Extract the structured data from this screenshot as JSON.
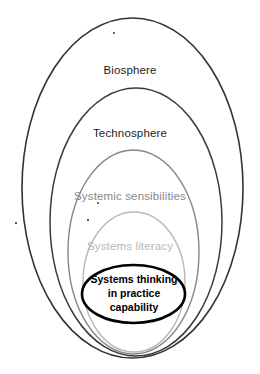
{
  "diagram": {
    "type": "nested-ellipses",
    "background_color": "#ffffff",
    "rings": [
      {
        "id": "biosphere",
        "label": "Biosphere",
        "level": 1,
        "stroke_color": "#333333",
        "stroke_width": 1.6,
        "text_color": "#1c1c1c",
        "bounds": {
          "left": 22,
          "top": 18,
          "right": 243,
          "bottom": 358
        }
      },
      {
        "id": "technosphere",
        "label": "Technosphere",
        "level": 2,
        "stroke_color": "#3a3a3a",
        "stroke_width": 1.5,
        "text_color": "#1c1c1c",
        "bounds": {
          "left": 50,
          "top": 88,
          "right": 222,
          "bottom": 356
        }
      },
      {
        "id": "systemic-sensibilities",
        "label": "Systemic sensibilities",
        "level": 3,
        "stroke_color": "#868686",
        "stroke_width": 1.4,
        "text_color": "#86888a",
        "bounds": {
          "left": 68,
          "top": 150,
          "right": 199,
          "bottom": 354
        }
      },
      {
        "id": "systems-literacy",
        "label": "Systems literacy",
        "level": 4,
        "stroke_color": "#b9b9b9",
        "stroke_width": 1.4,
        "text_color": "#b6b8ba",
        "bounds": {
          "left": 83,
          "top": 212,
          "right": 185,
          "bottom": 352
        }
      }
    ],
    "core": {
      "id": "systems-thinking-in-practice-capability",
      "lines": [
        "Systems thinking",
        "in practice",
        "capability"
      ],
      "full_label": "Systems thinking in practice capability",
      "stroke_color": "#000000",
      "stroke_width": 2.6,
      "text_color": "#000000",
      "bounds": {
        "left": 82,
        "top": 265,
        "right": 185,
        "bottom": 323
      }
    },
    "specks": [
      {
        "id": "speck-top",
        "x": 113,
        "y": 32,
        "size": 2
      },
      {
        "id": "speck-left",
        "x": 15,
        "y": 222,
        "size": 1.6
      },
      {
        "id": "speck-mid",
        "x": 97,
        "y": 202,
        "size": 2
      },
      {
        "id": "speck-lower",
        "x": 87,
        "y": 219,
        "size": 2.4
      }
    ]
  }
}
